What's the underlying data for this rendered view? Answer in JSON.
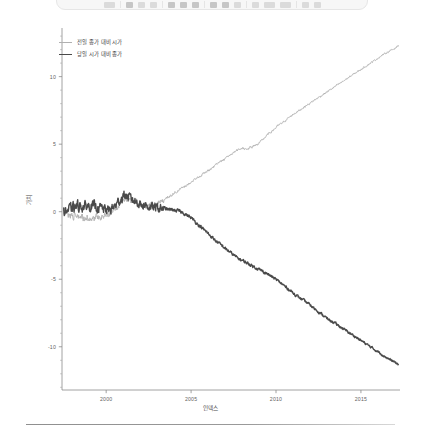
{
  "toolbar": {
    "icons": [
      "menu-icon",
      "separator-icon",
      "bold-icon",
      "italic-icon",
      "underline-icon",
      "separator-icon",
      "align-left-icon",
      "align-center-icon",
      "align-right-icon",
      "separator-icon",
      "list-bullet-icon",
      "list-number-icon",
      "indent-icon",
      "separator-icon",
      "link-icon",
      "image-icon",
      "table-icon",
      "separator-icon",
      "zoom-icon",
      "help-icon"
    ]
  },
  "chart_data": {
    "type": "line",
    "title": "",
    "subtitle": "",
    "xlabel": "인덱스",
    "ylabel": "가치",
    "grid": false,
    "legend_position": "top-left",
    "xlim": [
      1997.4,
      2017.3
    ],
    "ylim": [
      -13.2,
      13.6
    ],
    "xticks": [
      2000,
      2005,
      2010,
      2015
    ],
    "xtick_labels": [
      "2000",
      "2005",
      "2010",
      "2015"
    ],
    "yticks": [
      -10,
      -5,
      0,
      5,
      10
    ],
    "ytick_labels": [
      "-10",
      "-5",
      "0",
      "5",
      "10"
    ],
    "yminor_step": 1,
    "series": [
      {
        "name": "전일 종가 대비 시가",
        "color": "#b0b0b0",
        "width": 0.9,
        "x": [
          1997.5,
          1997.8,
          1998.1,
          1998.4,
          1998.7,
          1999.0,
          1999.3,
          1999.6,
          1999.9,
          2000.2,
          2000.5,
          2000.8,
          2001.1,
          2001.4,
          2001.7,
          2002.0,
          2002.3,
          2002.6,
          2002.9,
          2003.2,
          2003.5,
          2003.8,
          2004.1,
          2004.4,
          2004.7,
          2005.0,
          2005.3,
          2005.6,
          2005.9,
          2006.2,
          2006.5,
          2006.8,
          2007.1,
          2007.4,
          2007.7,
          2008.0,
          2008.3,
          2008.6,
          2008.9,
          2009.2,
          2009.5,
          2009.8,
          2010.1,
          2010.4,
          2010.7,
          2011.0,
          2011.3,
          2011.6,
          2011.9,
          2012.2,
          2012.5,
          2012.8,
          2013.1,
          2013.4,
          2013.7,
          2014.0,
          2014.3,
          2014.6,
          2014.9,
          2015.2,
          2015.5,
          2015.8,
          2016.1,
          2016.4,
          2016.7,
          2017.0,
          2017.2
        ],
        "y": [
          0.0,
          -0.15,
          -0.3,
          -0.45,
          -0.4,
          -0.5,
          -0.45,
          -0.35,
          -0.25,
          -0.1,
          0.3,
          0.6,
          1.0,
          0.85,
          0.7,
          0.55,
          0.45,
          0.4,
          0.5,
          0.7,
          0.95,
          1.2,
          1.45,
          1.7,
          1.95,
          2.2,
          2.45,
          2.7,
          2.95,
          3.2,
          3.5,
          3.75,
          4.0,
          4.3,
          4.55,
          4.7,
          4.65,
          4.8,
          5.0,
          5.3,
          5.7,
          6.0,
          6.35,
          6.6,
          6.9,
          7.2,
          7.45,
          7.7,
          7.95,
          8.2,
          8.45,
          8.7,
          8.95,
          9.2,
          9.45,
          9.7,
          9.95,
          10.2,
          10.45,
          10.7,
          10.95,
          11.2,
          11.45,
          11.7,
          11.9,
          12.1,
          12.3
        ]
      },
      {
        "name": "당일 시가 대비 종가",
        "color": "#4a4a4a",
        "width": 1.4,
        "x": [
          1997.5,
          1997.8,
          1998.1,
          1998.4,
          1998.7,
          1999.0,
          1999.3,
          1999.6,
          1999.9,
          2000.2,
          2000.5,
          2000.8,
          2001.1,
          2001.4,
          2001.7,
          2002.0,
          2002.3,
          2002.6,
          2002.9,
          2003.2,
          2003.5,
          2003.8,
          2004.1,
          2004.4,
          2004.7,
          2005.0,
          2005.3,
          2005.6,
          2005.9,
          2006.2,
          2006.5,
          2006.8,
          2007.1,
          2007.4,
          2007.7,
          2008.0,
          2008.3,
          2008.6,
          2008.9,
          2009.2,
          2009.5,
          2009.8,
          2010.1,
          2010.4,
          2010.7,
          2011.0,
          2011.3,
          2011.6,
          2011.9,
          2012.2,
          2012.5,
          2012.8,
          2013.1,
          2013.4,
          2013.7,
          2014.0,
          2014.3,
          2014.6,
          2014.9,
          2015.2,
          2015.5,
          2015.8,
          2016.1,
          2016.4,
          2016.7,
          2017.0,
          2017.2
        ],
        "y": [
          0.0,
          0.15,
          0.3,
          0.45,
          0.35,
          0.45,
          0.4,
          0.3,
          0.2,
          0.1,
          0.4,
          0.85,
          1.25,
          1.0,
          0.8,
          0.6,
          0.45,
          0.35,
          0.3,
          0.25,
          0.2,
          0.15,
          0.1,
          0.0,
          -0.2,
          -0.45,
          -0.8,
          -1.15,
          -1.5,
          -1.85,
          -2.2,
          -2.5,
          -2.8,
          -3.1,
          -3.4,
          -3.6,
          -3.8,
          -4.0,
          -4.2,
          -4.4,
          -4.6,
          -4.85,
          -5.1,
          -5.4,
          -5.7,
          -6.0,
          -6.3,
          -6.55,
          -6.8,
          -7.1,
          -7.4,
          -7.7,
          -8.0,
          -8.2,
          -8.45,
          -8.7,
          -8.95,
          -9.2,
          -9.45,
          -9.7,
          -9.95,
          -10.2,
          -10.45,
          -10.7,
          -10.95,
          -11.15,
          -11.3
        ]
      }
    ]
  }
}
